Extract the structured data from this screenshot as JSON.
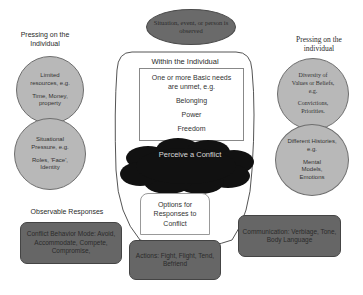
{
  "diagram": {
    "top_event": "Situation, event, or person is observed",
    "center": {
      "container_title": "Within the Individual",
      "needs_box": {
        "heading": "One or more Basic needs are unmet, e.g.",
        "items": [
          "Belonging",
          "Power",
          "Freedom"
        ]
      },
      "cloud_label": "Perceive a Conflict",
      "options_box": "Options for Responses to Conflict"
    },
    "left": {
      "heading": "Pressing on the Individual",
      "circles": [
        {
          "title": "Limited resources, e.g.",
          "examples": "Time, Money, property"
        },
        {
          "title": "Situational Pressure, e.g.",
          "examples": "Roles, 'Face', Identity"
        }
      ]
    },
    "right": {
      "heading": "Pressing on the individual",
      "circles": [
        {
          "title": "Diversity of Values or Beliefs, e.g.",
          "examples": "Convictions, Priorities."
        },
        {
          "title": "Different Histories, e.g.",
          "examples": "Mental Models, Emotions"
        }
      ]
    },
    "observable": {
      "heading": "Observable Responses",
      "boxes": [
        {
          "id": "behavior",
          "text": "Conflict Behavior Mode: Avoid, Accommodate, Compete, Compromise,"
        },
        {
          "id": "actions",
          "text": "Actions: Fight, Flight, Tend, Befriend"
        },
        {
          "id": "communication",
          "text": "Communication: Verbiage, Tone, Body Language"
        }
      ]
    },
    "colors": {
      "circle_fill": "#b8b8b8",
      "dark_box_fill": "#666666",
      "cloud_fill": "#111111",
      "line": "#555555"
    }
  }
}
